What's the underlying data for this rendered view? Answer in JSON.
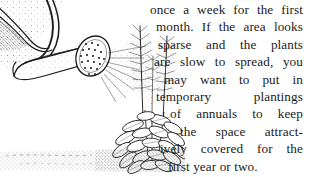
{
  "page": {
    "background_color": "#ffffff",
    "ink_color": "#1a1a1a",
    "width": 309,
    "height": 177
  },
  "illustration": {
    "name": "watering-can-sprinkling-plants",
    "description": "Pen and ink line drawing of a watering can spout with a sprinkler rose spraying water onto leafy plants growing in stippled ground",
    "parts": [
      "watering-can-body",
      "watering-can-handle",
      "watering-can-spout",
      "sprinkler-rose-head",
      "water-spray",
      "tall-flower-spikes",
      "leafy-plant",
      "ground-stipple"
    ]
  },
  "body_text": {
    "lines": [
      "once a week for the first",
      "month. If the area looks",
      "sparse and the plants",
      "are slow to spread, you",
      "may want to put in",
      "temporary plantings",
      "of annuals to keep",
      "the space attract-",
      "ively covered for the",
      "first year or two."
    ],
    "full_text": "once a week for the first month. If the area looks sparse and the plants are slow to spread, you may want to put in temporary plantings of annuals to keep the space attractively covered for the first year or two."
  }
}
